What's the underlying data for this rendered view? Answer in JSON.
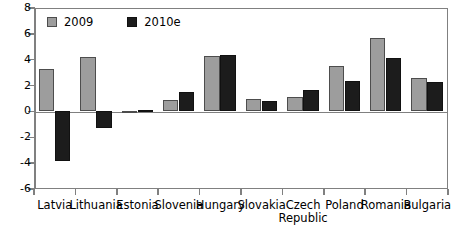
{
  "chart_data": {
    "type": "bar",
    "title": "",
    "subtitle": "",
    "xlabel": "",
    "ylabel": "",
    "ylim": [
      -6,
      8
    ],
    "yticks": [
      8,
      6,
      4,
      2,
      0,
      -2,
      -4,
      -6
    ],
    "ytick_labels": [
      "8",
      "6",
      "4",
      "2",
      "0",
      "-2",
      "-4",
      "-6"
    ],
    "grid": false,
    "legend_position": "top-left",
    "categories": [
      "Latvia",
      "Lithuania",
      "Estonia",
      "Slovenia",
      "Hungary",
      "Slovakia",
      "Czech Republic",
      "Poland",
      "Romania",
      "Bulgaria"
    ],
    "category_lines": [
      [
        "Latvia"
      ],
      [
        "Lithuania"
      ],
      [
        "Estonia"
      ],
      [
        "Slovenia"
      ],
      [
        "Hungary"
      ],
      [
        "Slovakia"
      ],
      [
        "Czech",
        "Republic"
      ],
      [
        "Poland"
      ],
      [
        "Romania"
      ],
      [
        "Bulgaria"
      ]
    ],
    "series": [
      {
        "name": "2009",
        "color": "#9d9d9d",
        "values": [
          3.3,
          4.2,
          -0.15,
          0.9,
          4.3,
          1.0,
          1.1,
          3.5,
          5.7,
          2.55
        ]
      },
      {
        "name": "2010e",
        "color": "#1c1c1c",
        "values": [
          -3.8,
          -1.3,
          0.1,
          1.5,
          4.4,
          0.8,
          1.65,
          2.35,
          4.1,
          2.3
        ]
      }
    ]
  },
  "legend": {
    "items": [
      {
        "label": "2009"
      },
      {
        "label": "2010e"
      }
    ]
  }
}
